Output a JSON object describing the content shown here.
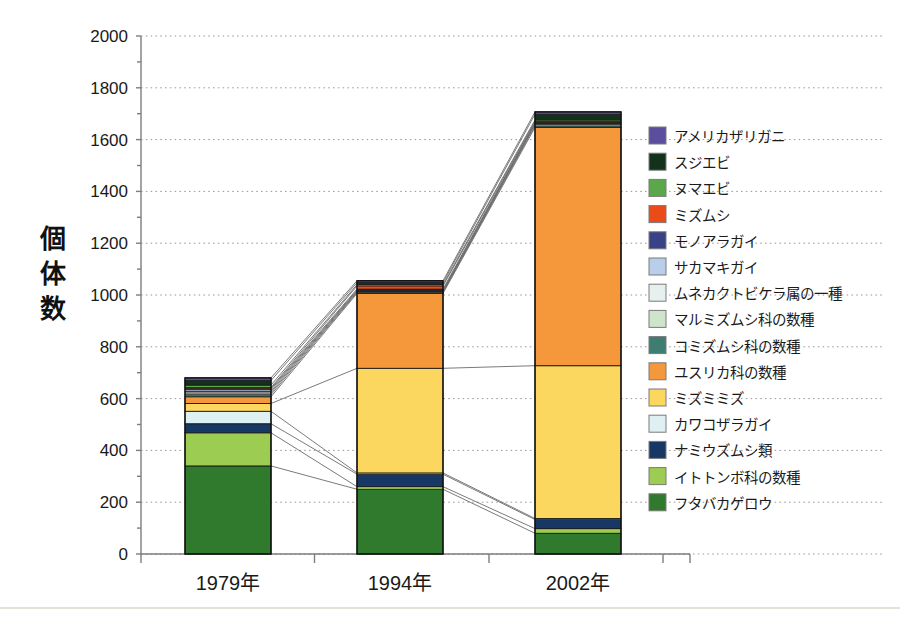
{
  "chart_data": {
    "type": "bar",
    "subtype": "stacked-bar-with-connectors",
    "title": "",
    "xlabel": "",
    "ylabel": "個体数",
    "categories": [
      "1979年",
      "1994年",
      "2002年"
    ],
    "ylim": [
      0,
      2000
    ],
    "ytick_step": 200,
    "ytick_labels": [
      "0",
      "200",
      "400",
      "600",
      "800",
      "1000",
      "1200",
      "1400",
      "1600",
      "1800",
      "2000"
    ],
    "grid": true,
    "legend_position": "right",
    "totals": [
      680,
      1035,
      1690
    ],
    "series": [
      {
        "name": "アメリカザリガニ",
        "color": "#5b4e9e",
        "values": [
          10,
          7,
          9
        ]
      },
      {
        "name": "スジエビ",
        "color": "#12331a",
        "values": [
          18,
          8,
          22
        ]
      },
      {
        "name": "ヌマエビ",
        "color": "#5aa84b",
        "values": [
          9,
          5,
          5
        ]
      },
      {
        "name": "ミズムシ",
        "color": "#eb4b18",
        "values": [
          4,
          12,
          4
        ]
      },
      {
        "name": "モノアラガイ",
        "color": "#3a4287",
        "values": [
          5,
          4,
          3
        ]
      },
      {
        "name": "サカマキガイ",
        "color": "#b9cee8",
        "values": [
          6,
          3,
          3
        ]
      },
      {
        "name": "ムネカクトビケラ属の一種",
        "color": "#e6f1ef",
        "values": [
          6,
          3,
          3
        ]
      },
      {
        "name": "マルミズムシ科の数種",
        "color": "#cfe3cd",
        "values": [
          7,
          3,
          5
        ]
      },
      {
        "name": "コミズムシ科の数種",
        "color": "#3f7d72",
        "values": [
          8,
          4,
          6
        ]
      },
      {
        "name": "ユスリカ科の数種",
        "color": "#f5983c",
        "values": [
          26,
          289,
          920
        ]
      },
      {
        "name": "ミズミミズ",
        "color": "#fbd760",
        "values": [
          30,
          404,
          590
        ]
      },
      {
        "name": "カワコザラガイ",
        "color": "#dff0f2",
        "values": [
          48,
          5,
          4
        ]
      },
      {
        "name": "ナミウズムシ類",
        "color": "#173764",
        "values": [
          35,
          48,
          35
        ]
      },
      {
        "name": "イトトンボ科の数種",
        "color": "#9ccc52",
        "values": [
          128,
          10,
          18
        ]
      },
      {
        "name": "フタバカゲロウ",
        "color": "#2f7a2c",
        "values": [
          340,
          250,
          80
        ]
      }
    ]
  },
  "axis": {
    "y_title": "個体数",
    "y_title_chars": [
      "個",
      "体",
      "数"
    ]
  }
}
